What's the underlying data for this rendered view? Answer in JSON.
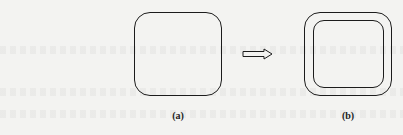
{
  "figure": {
    "panels": [
      {
        "id": "a",
        "label": "(a)",
        "shape": "rounded-square",
        "rings": 1
      },
      {
        "id": "b",
        "label": "(b)",
        "shape": "rounded-square",
        "rings": 2
      }
    ],
    "arrow": {
      "direction": "right",
      "style": "hollow"
    },
    "colors": {
      "stroke": "#1c1c1c",
      "background": "#f3f3f1"
    }
  }
}
